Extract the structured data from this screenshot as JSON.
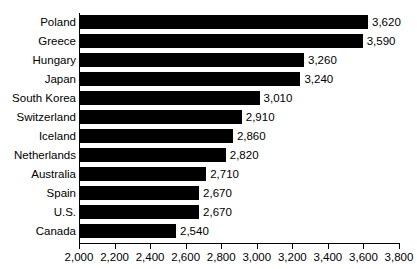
{
  "chart_data": {
    "type": "bar",
    "orientation": "horizontal",
    "title": "",
    "subtitle": "",
    "xlabel": "",
    "ylabel": "",
    "xlim": [
      2000,
      3800
    ],
    "xtick_step": 200,
    "grid": false,
    "legend": null,
    "bar_color": "#000000",
    "background_color": "#ffffff",
    "categories": [
      "Poland",
      "Greece",
      "Hungary",
      "Japan",
      "South Korea",
      "Switzerland",
      "Iceland",
      "Netherlands",
      "Australia",
      "Spain",
      "U.S.",
      "Canada"
    ],
    "values": [
      3620,
      3590,
      3260,
      3240,
      3010,
      2910,
      2860,
      2820,
      2710,
      2670,
      2670,
      2540
    ],
    "value_labels": [
      "3,620",
      "3,590",
      "3,260",
      "3,240",
      "3,010",
      "2,910",
      "2,860",
      "2,820",
      "2,710",
      "2,670",
      "2,670",
      "2,540"
    ],
    "xtick_labels": [
      "2,000",
      "2,200",
      "2,400",
      "2,600",
      "2,800",
      "3,000",
      "3,200",
      "3,400",
      "3,600",
      "3,800"
    ],
    "xtick_values": [
      2000,
      2200,
      2400,
      2600,
      2800,
      3000,
      3200,
      3400,
      3600,
      3800
    ]
  }
}
